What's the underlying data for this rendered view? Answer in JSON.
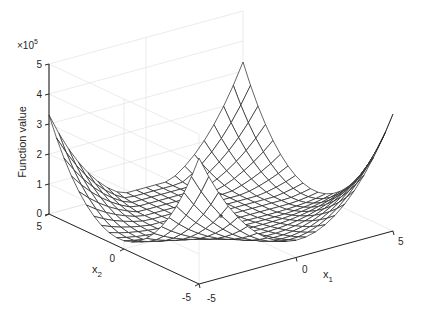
{
  "chart_data": {
    "type": "surface3d",
    "title": "",
    "xlabel": "x_1",
    "ylabel": "x_2",
    "zlabel": "Function value",
    "z_exponent_label": "×10",
    "z_exponent": "5",
    "xlim": [
      -5,
      5
    ],
    "ylim": [
      -5,
      5
    ],
    "zlim": [
      0,
      500000
    ],
    "x_ticks": [
      "-5",
      "0",
      "5"
    ],
    "y_ticks": [
      "-5",
      "0",
      "5"
    ],
    "z_ticks": [
      "0",
      "1",
      "2",
      "3",
      "4",
      "5"
    ],
    "grid": true,
    "grid_resolution": 21,
    "surface_model": {
      "formula": "A*(x1^4+x2^4) + B*x1^2*x2^2 + C*x1*x2 + D1*x1 + D2*x2",
      "A": 32,
      "B": 524,
      "C": 300,
      "D1": -1500,
      "D2": -7500
    },
    "corner_values": [
      {
        "x1": -5,
        "x2": 5,
        "z": 330000
      },
      {
        "x1": -5,
        "x2": -5,
        "z": 420000
      },
      {
        "x1": 5,
        "x2": -5,
        "z": 390000
      },
      {
        "x1": 5,
        "x2": 5,
        "z": 330000
      }
    ],
    "marker": {
      "x1": 0,
      "x2": 0,
      "z": 0,
      "symbol": "*"
    }
  },
  "projection": {
    "origin": [
      221,
      222.5
    ],
    "ex": [
      19.4,
      -5.3
    ],
    "ey": [
      -15,
      -7
    ],
    "z_px_per_unit": 0.0003
  },
  "colors": {
    "axis": "#262626",
    "grid": "#e6e6e6",
    "mesh": "#222222",
    "face": "#ffffff"
  }
}
